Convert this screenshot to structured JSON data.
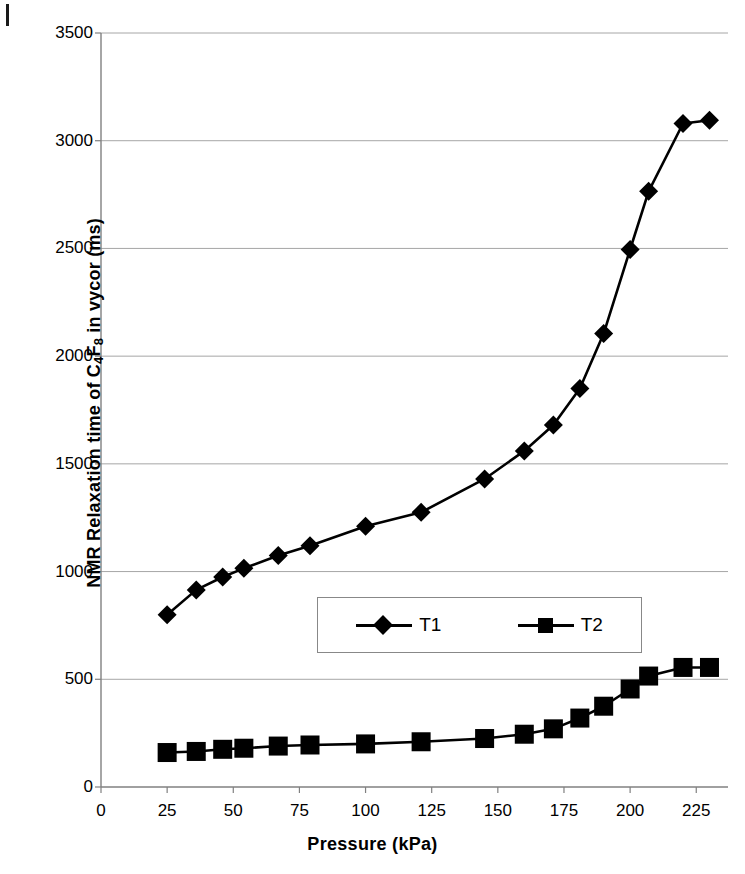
{
  "chart_data": {
    "type": "line",
    "title": "",
    "xlabel": "Pressure (kPa)",
    "ylabel_parts": {
      "pre": "NMR Relaxation time of C",
      "sub1": "4",
      "mid": "F",
      "sub2": "8",
      "post": " in vycor (ms)"
    },
    "ylabel": "NMR Relaxation time of C4F8 in vycor (ms)",
    "xlim": [
      0,
      237
    ],
    "ylim": [
      0,
      3500
    ],
    "xticks": [
      0,
      25,
      50,
      75,
      100,
      125,
      150,
      175,
      200,
      225
    ],
    "yticks": [
      0,
      500,
      1000,
      1500,
      2000,
      2500,
      3000,
      3500
    ],
    "grid": "horizontal",
    "legend_position": "inside-center",
    "marker_color": "#000000",
    "line_color": "#000000",
    "grid_color": "#a6a6a6",
    "axis_color": "#808080",
    "series": [
      {
        "name": "T1",
        "marker": "diamond",
        "x": [
          25,
          36,
          46,
          54,
          67,
          79,
          100,
          121,
          145,
          160,
          171,
          181,
          190,
          200,
          207,
          220,
          230
        ],
        "values": [
          800,
          915,
          975,
          1015,
          1075,
          1120,
          1210,
          1275,
          1430,
          1560,
          1680,
          1850,
          2105,
          2495,
          2765,
          3080,
          3095
        ]
      },
      {
        "name": "T2",
        "marker": "square",
        "x": [
          25,
          36,
          46,
          54,
          67,
          79,
          100,
          121,
          145,
          160,
          171,
          181,
          190,
          200,
          207,
          220,
          230
        ],
        "values": [
          160,
          165,
          175,
          180,
          190,
          195,
          200,
          210,
          225,
          245,
          270,
          320,
          375,
          455,
          515,
          555,
          555
        ]
      }
    ]
  },
  "legend": {
    "items": [
      {
        "label": "T1",
        "marker": "diamond"
      },
      {
        "label": "T2",
        "marker": "square"
      }
    ]
  },
  "axis": {
    "x_title": "Pressure (kPa)",
    "y_title_pre": "NMR Relaxation time of C",
    "y_title_sub1": "4",
    "y_title_mid": "F",
    "y_title_sub2": "8",
    "y_title_post": " in vycor (ms)",
    "xtick_labels": [
      "0",
      "25",
      "50",
      "75",
      "100",
      "125",
      "150",
      "175",
      "200",
      "225"
    ],
    "ytick_labels": [
      "0",
      "500",
      "1000",
      "1500",
      "2000",
      "2500",
      "3000",
      "3500"
    ]
  }
}
